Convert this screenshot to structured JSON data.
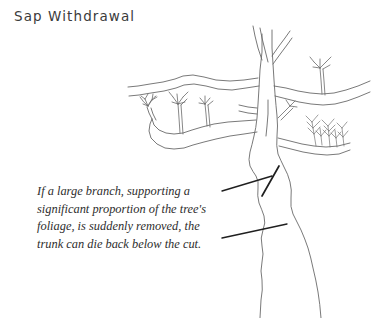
{
  "figure": {
    "title": "Sap Withdrawal",
    "background_color": "#ffffff",
    "ink_color": "#6a6a6a",
    "text_color": "#2e2e2e",
    "title_color": "#3b3b3b"
  },
  "caption": {
    "lines": [
      "If a large branch, supporting a",
      "significant proportion of the tree's",
      "foliage, is suddenly removed, the",
      "trunk can die back below the cut."
    ],
    "full_text": "If a large branch, supporting a significant proportion of the tree's foliage, is suddenly removed, the trunk can die back below the cut."
  },
  "illustration": {
    "subject": "tree-line-drawing",
    "elements": [
      "main-trunk",
      "upper-fork",
      "left-long-branch",
      "left-leafy-branch",
      "right-branch",
      "leaf-sprout-cluster",
      "twig-cluster",
      "pruning-cut-mark"
    ],
    "leader_lines": [
      "leader-line-to-cut",
      "leader-line-to-trunk"
    ]
  }
}
